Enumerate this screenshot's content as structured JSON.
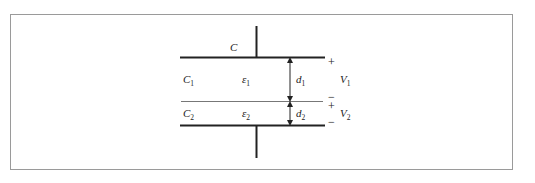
{
  "diagram": {
    "title_label": "C",
    "layers": [
      {
        "capacitance": "C",
        "capacitance_sub": "1",
        "permittivity": "ε",
        "permittivity_sub": "1",
        "thickness": "d",
        "thickness_sub": "1",
        "voltage": "V",
        "voltage_sub": "1",
        "top_sign": "+",
        "bottom_sign": "−"
      },
      {
        "capacitance": "C",
        "capacitance_sub": "2",
        "permittivity": "ε",
        "permittivity_sub": "2",
        "thickness": "d",
        "thickness_sub": "2",
        "voltage": "V",
        "voltage_sub": "2",
        "top_sign": "+",
        "bottom_sign": "−"
      }
    ],
    "colors": {
      "plate": "#222222",
      "interface": "#777777",
      "frame": "#9a9a9a"
    }
  }
}
